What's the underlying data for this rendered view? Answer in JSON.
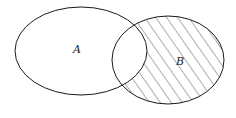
{
  "diagram": {
    "type": "venn",
    "sets": [
      {
        "label": "A",
        "cx": 81,
        "cy": 51,
        "rx": 66,
        "ry": 44
      },
      {
        "label": "B",
        "cx": 168,
        "cy": 60,
        "rx": 56,
        "ry": 44
      }
    ],
    "shaded_region": "B minus A",
    "stroke_color": "#1a1a1a",
    "hatch_color": "#333333"
  }
}
